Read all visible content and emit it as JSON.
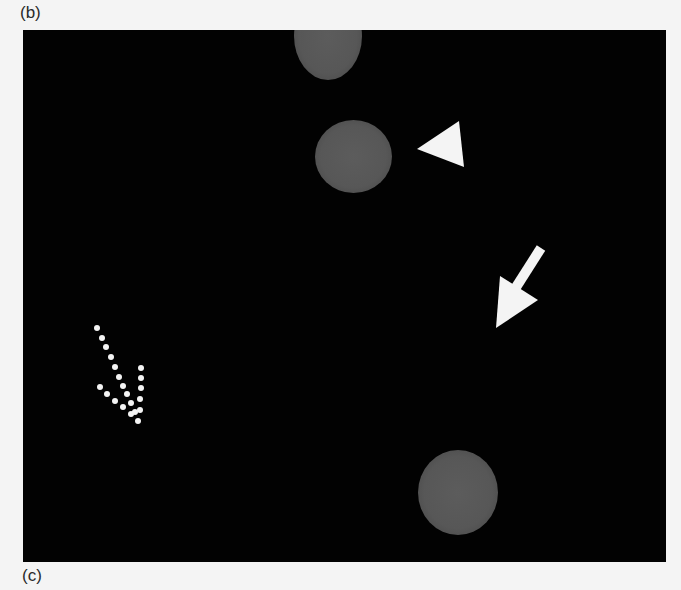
{
  "figure": {
    "panel_labels": {
      "top": "(b)",
      "bottom": "(c)"
    },
    "background_color": "#020202",
    "cell_color": "#575757",
    "marker_color": "#f4f4f4",
    "cells": [
      {
        "name": "top-cell",
        "cx": 305,
        "cy": 12,
        "w": 68,
        "h": 100
      },
      {
        "name": "middle-cell",
        "cx": 330,
        "cy": 127,
        "w": 78,
        "h": 74
      },
      {
        "name": "bottom-cell",
        "cx": 434,
        "cy": 463,
        "w": 80,
        "h": 86
      }
    ],
    "markers": [
      {
        "type": "arrowhead",
        "points": "394,119 436,91 441,137"
      },
      {
        "type": "solid-arrow",
        "direction": "down-left"
      },
      {
        "type": "dotted-arrow",
        "direction": "down-right"
      }
    ]
  }
}
